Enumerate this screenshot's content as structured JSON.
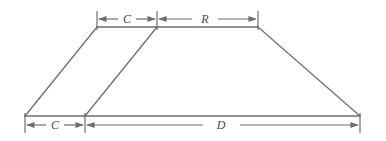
{
  "diagram": {
    "background_color": "#ffffff",
    "line_color": "#6e6e6e",
    "label_color": "#4a4a4a",
    "labels": {
      "top_left": "C",
      "top_right": "R",
      "bottom_left": "C",
      "bottom_right": "D"
    },
    "dimensions": [
      {
        "name": "crest-width-top",
        "label": "C",
        "position": "top",
        "from_x": 97,
        "to_x": 157,
        "y": 19
      },
      {
        "name": "roadway-width-top",
        "label": "R",
        "position": "top",
        "from_x": 157,
        "to_x": 258,
        "y": 19
      },
      {
        "name": "offset-width-bottom",
        "label": "C",
        "position": "bottom",
        "from_x": 25,
        "to_x": 85,
        "y": 125
      },
      {
        "name": "base-width-bottom",
        "label": "D",
        "position": "bottom",
        "from_x": 85,
        "to_x": 360,
        "y": 125
      }
    ],
    "geometry": {
      "trapezoid": {
        "top_left": [
          97,
          27
        ],
        "top_right": [
          258,
          27
        ],
        "bottom_right": [
          360,
          116
        ],
        "bottom_left": [
          25,
          116
        ]
      },
      "interior_slant": {
        "top": [
          157,
          27
        ],
        "bottom": [
          85,
          116
        ]
      }
    }
  }
}
